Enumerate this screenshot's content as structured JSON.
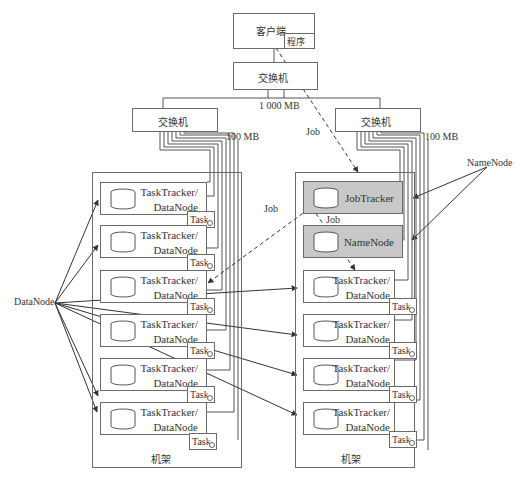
{
  "client": {
    "label": "客户端",
    "program_label": "程序"
  },
  "core_switch": {
    "label": "交换机"
  },
  "links": {
    "core_bandwidth": "1 000 MB",
    "rack_bandwidth": "100 MB",
    "job_label": "Job"
  },
  "left_rack": {
    "switch_label": "交换机",
    "rack_label": "机架",
    "nodes": [
      {
        "line1": "TaskTracker/",
        "line2": "DataNode",
        "task": "Task"
      },
      {
        "line1": "TaskTracker/",
        "line2": "DataNode",
        "task": "Task"
      },
      {
        "line1": "TaskTracker/",
        "line2": "DataNode",
        "task": "Task"
      },
      {
        "line1": "TaskTracker/",
        "line2": "DataNode",
        "task": "Task"
      },
      {
        "line1": "TaskTracker/",
        "line2": "DataNode",
        "task": "Task"
      },
      {
        "line1": "TaskTracker/",
        "line2": "DataNode",
        "task": "Task"
      }
    ]
  },
  "right_rack": {
    "switch_label": "交换机",
    "rack_label": "机架",
    "masters": [
      {
        "label": "JobTracker"
      },
      {
        "label": "NameNode"
      }
    ],
    "nodes": [
      {
        "line1": "TaskTracker/",
        "line2": "DataNode",
        "task": "Task"
      },
      {
        "line1": "TaskTracker/",
        "line2": "DataNode",
        "task": "Task"
      },
      {
        "line1": "TaskTracker/",
        "line2": "DataNode",
        "task": "Task"
      },
      {
        "line1": "TaskTracker/",
        "line2": "DataNode",
        "task": "Task"
      }
    ]
  },
  "callouts": {
    "datanode": "DataNode",
    "namenode": "NameNode"
  },
  "colors": {
    "line": "#555555",
    "master_fill": "#c8c8c8",
    "background": "#ffffff"
  }
}
